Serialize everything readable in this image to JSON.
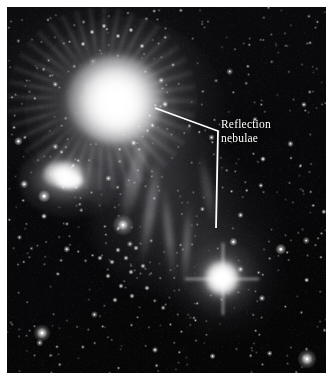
{
  "image": {
    "kind": "astronomical-photograph",
    "subject": "reflection nebulae",
    "palette": "monochrome black and white",
    "plate": {
      "background_color": "#050507",
      "star_color": "#ffffff",
      "nebula_color": "#f2f2f4",
      "margin_color": "#ffffff"
    }
  },
  "annotations": [
    {
      "id": "reflection-nebulae",
      "label_line1": "Reflection",
      "label_line2": "nebulae",
      "color": "#ffffff",
      "leader": {
        "type": "elbow-with-branch",
        "branch1_end": [
          155,
          108
        ],
        "vertex": [
          218,
          131
        ],
        "branch2_end": [
          216,
          228
        ]
      }
    }
  ],
  "features": [
    {
      "name": "main-reflection-nebula",
      "center": [
        105,
        96
      ],
      "brightness": "very-bright",
      "description": "large fuzzy glowing nebula with radial streamers, upper left"
    },
    {
      "name": "secondary-bright-patch",
      "center": [
        57,
        170
      ],
      "brightness": "bright",
      "description": "smaller irregular bright knot, left of center"
    },
    {
      "name": "illuminating-star",
      "center": [
        215,
        271
      ],
      "brightness": "very-bright",
      "description": "bright star embedded in reflection nebulosity, lower right"
    },
    {
      "name": "moderate-star",
      "center": [
        123,
        225
      ],
      "brightness": "moderate",
      "description": "moderately bright star in mid field"
    },
    {
      "name": "corner-star",
      "center": [
        307,
        359
      ],
      "brightness": "moderate",
      "description": "bright star near bottom right corner"
    },
    {
      "name": "field-star",
      "center": [
        42,
        333
      ],
      "brightness": "moderate",
      "description": "bright star in lower left dark field"
    },
    {
      "name": "nebular-filaments",
      "center": [
        160,
        215
      ],
      "brightness": "faint",
      "description": "wispy vertical dust filaments between the two nebulae"
    }
  ],
  "starfield": {
    "seed": 20240517,
    "count": 520,
    "description": "dense field of faint to moderate stars across the whole plate"
  }
}
